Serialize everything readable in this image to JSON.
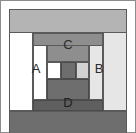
{
  "figure": {
    "kind": "nested-rectangles-diagram",
    "width": 136,
    "height": 133,
    "background": "#ffffff",
    "labels": {
      "left": "A",
      "right": "B",
      "top": "C",
      "bottom": "D"
    },
    "label_color": "#2b2b2b",
    "colors": {
      "canvas": "#ffffff",
      "outline": "#555555",
      "light_gray": "#b4b4b4",
      "mid_gray": "#8e8e8e",
      "dark_gray": "#6e6e6e",
      "darker_gray": "#5f5f5f",
      "white": "#ffffff",
      "pale_gray": "#d9d9d9"
    },
    "regions": [
      {
        "name": "outer-frame-top-band",
        "fill": "#b4b4b4",
        "x": 9,
        "y": 9,
        "w": 118,
        "h": 24
      },
      {
        "name": "outer-frame-left-band",
        "fill": "#ffffff",
        "x": 9,
        "y": 33,
        "w": 24,
        "h": 78
      },
      {
        "name": "outer-frame-right-band",
        "fill": "#e2e2e2",
        "x": 103,
        "y": 33,
        "w": 24,
        "h": 78
      },
      {
        "name": "outer-frame-bottom-band",
        "fill": "#6e6e6e",
        "x": 9,
        "y": 111,
        "w": 118,
        "h": 22
      },
      {
        "name": "band-c-top",
        "fill": "#8e8e8e",
        "x": 33,
        "y": 33,
        "w": 70,
        "h": 22
      },
      {
        "name": "band-left-white",
        "fill": "#ffffff",
        "x": 33,
        "y": 55,
        "w": 14,
        "h": 45
      },
      {
        "name": "band-right-pale",
        "fill": "#e2e2e2",
        "x": 89,
        "y": 55,
        "w": 14,
        "h": 45
      },
      {
        "name": "band-d-bottom",
        "fill": "#5f5f5f",
        "x": 33,
        "y": 100,
        "w": 70,
        "h": 11
      },
      {
        "name": "inner-upper-gray",
        "fill": "#8e8e8e",
        "x": 47,
        "y": 45,
        "w": 42,
        "h": 17
      },
      {
        "name": "inner-cell-white",
        "fill": "#ffffff",
        "x": 47,
        "y": 62,
        "w": 14,
        "h": 17
      },
      {
        "name": "inner-cell-dark",
        "fill": "#6e6e6e",
        "x": 61,
        "y": 62,
        "w": 15,
        "h": 17
      },
      {
        "name": "inner-cell-light",
        "fill": "#d2d2d2",
        "x": 76,
        "y": 62,
        "w": 13,
        "h": 17
      },
      {
        "name": "inner-lower-dark",
        "fill": "#6e6e6e",
        "x": 47,
        "y": 79,
        "w": 42,
        "h": 21
      }
    ]
  }
}
